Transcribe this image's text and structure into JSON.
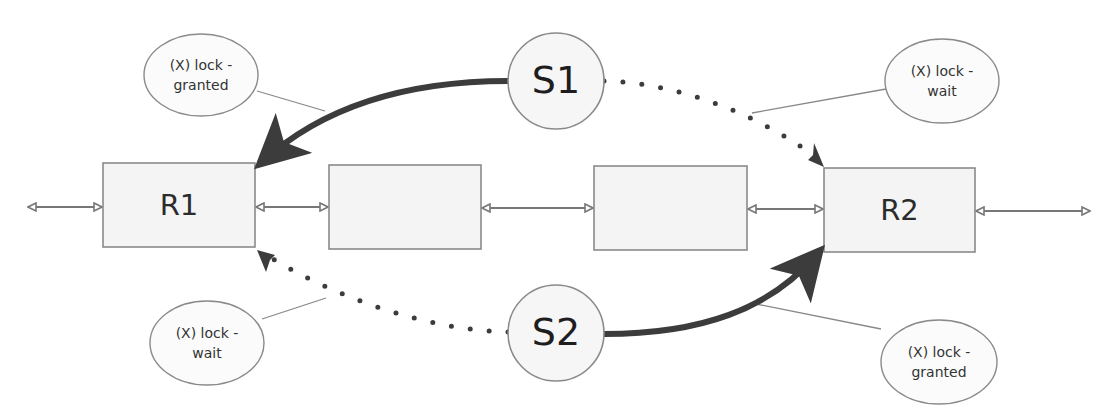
{
  "diagram": {
    "title": "",
    "colors": {
      "box_fill": "#f4f4f4",
      "box_stroke": "#8a8a8a",
      "arrow": "#3c3c3c",
      "connector": "#7a7a7a",
      "text": "#2b2b2b"
    },
    "resources": [
      {
        "id": "r1",
        "label": "R1"
      },
      {
        "id": "r-mid-1",
        "label": ""
      },
      {
        "id": "r-mid-2",
        "label": ""
      },
      {
        "id": "r2",
        "label": "R2"
      }
    ],
    "sessions": [
      {
        "id": "s1",
        "label": "S1"
      },
      {
        "id": "s2",
        "label": "S2"
      }
    ],
    "edges": [
      {
        "from": "S1",
        "to": "R1",
        "style": "solid",
        "meaning": "(X) lock - granted"
      },
      {
        "from": "S1",
        "to": "R2",
        "style": "dotted",
        "meaning": "(X) lock - wait"
      },
      {
        "from": "S2",
        "to": "R1",
        "style": "dotted",
        "meaning": "(X) lock - wait"
      },
      {
        "from": "S2",
        "to": "R2",
        "style": "solid",
        "meaning": "(X) lock - granted"
      }
    ],
    "callouts": {
      "top_left": {
        "line1": "(X) lock -",
        "line2": "granted"
      },
      "top_right": {
        "line1": "(X) lock -",
        "line2": "wait"
      },
      "bottom_left": {
        "line1": "(X) lock -",
        "line2": "wait"
      },
      "bottom_right": {
        "line1": "(X) lock -",
        "line2": "granted"
      }
    }
  }
}
